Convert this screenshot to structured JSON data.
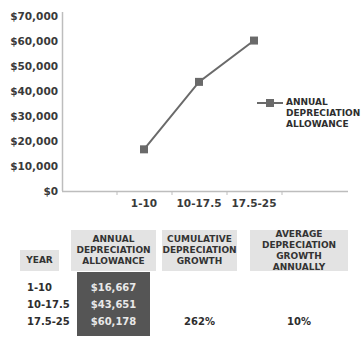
{
  "chart_data": {
    "type": "line",
    "title": "",
    "xlabel": "",
    "ylabel": "",
    "categories": [
      "1-10",
      "10-17.5",
      "17.5-25"
    ],
    "series": [
      {
        "name": "ANNUAL DEPRECIATION ALLOWANCE",
        "values": [
          16667,
          43651,
          60178
        ],
        "color": "#6a6a6a"
      }
    ],
    "ylim": [
      0,
      70000
    ],
    "yticks": [
      "$0",
      "$10,000",
      "$20,000",
      "$30,000",
      "$40,000",
      "$50,000",
      "$60,000",
      "$70,000"
    ],
    "grid": false,
    "legend_position": "right"
  },
  "legend": {
    "line1": "ANNUAL",
    "line2": "DEPRECIATION",
    "line3": "ALLOWANCE"
  },
  "table": {
    "headers": {
      "year": "YEAR",
      "annual": [
        "ANNUAL",
        "DEPRECIATION",
        "ALLOWANCE"
      ],
      "cumulative": [
        "CUMULATIVE",
        "DEPRECIATION",
        "GROWTH"
      ],
      "average": [
        "AVERAGE",
        "DEPRECIATION",
        "GROWTH ANNUALLY"
      ]
    },
    "rows": [
      {
        "year": "1-10",
        "annual": "$16,667",
        "cumulative": "",
        "average": ""
      },
      {
        "year": "10-17.5",
        "annual": "$43,651",
        "cumulative": "",
        "average": ""
      },
      {
        "year": "17.5-25",
        "annual": "$60,178",
        "cumulative": "262%",
        "average": "10%"
      }
    ]
  },
  "colors": {
    "line": "#6a6a6a",
    "axis": "#b8b8b8",
    "header_bg": "#e3e3e3",
    "highlight_bg": "#555555"
  }
}
